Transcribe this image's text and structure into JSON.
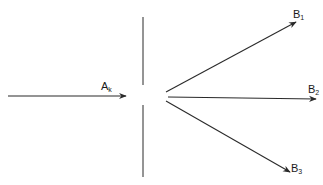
{
  "diagram": {
    "type": "beam-splitting",
    "stroke_color": "#2a2a2a",
    "background": "#ffffff",
    "incident": {
      "label_main": "A",
      "label_sub": "k",
      "from": [
        8,
        96
      ],
      "to": [
        126,
        96
      ]
    },
    "barrier": {
      "x": 143,
      "segments": [
        [
          17,
          85
        ],
        [
          105,
          177
        ]
      ]
    },
    "outputs": [
      {
        "label_main": "B",
        "label_sub": "1",
        "from": [
          166,
          92
        ],
        "to": [
          296,
          22
        ],
        "label_pos": [
          293,
          9
        ]
      },
      {
        "label_main": "B",
        "label_sub": "2",
        "from": [
          168,
          97
        ],
        "to": [
          316,
          99
        ],
        "label_pos": [
          308,
          84
        ]
      },
      {
        "label_main": "B",
        "label_sub": "3",
        "from": [
          166,
          101
        ],
        "to": [
          290,
          172
        ],
        "label_pos": [
          291,
          163
        ]
      }
    ],
    "incident_label_pos": [
      101,
      81
    ]
  }
}
